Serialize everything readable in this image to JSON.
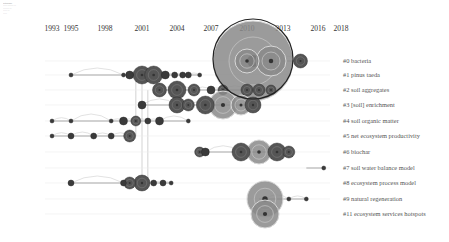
{
  "legend": {
    "lines": [
      "CiteSpace",
      "",
      "",
      "",
      ""
    ]
  },
  "chart_data": {
    "type": "timeline",
    "title": "",
    "xlabel": "",
    "ylabel": "",
    "x_ticks": [
      1993,
      1995,
      1998,
      2001,
      2004,
      2007,
      2010,
      2013,
      2016,
      2018
    ],
    "x_range": [
      1992,
      2018
    ],
    "clusters": [
      {
        "id": 0,
        "label": "#0 bacteria",
        "y": 61,
        "start": 2009,
        "end": 2015,
        "nodes": [
          {
            "year": 2010.5,
            "size": 40
          },
          {
            "year": 2010,
            "size": 12
          },
          {
            "year": 2012,
            "size": 15
          },
          {
            "year": 2014.5,
            "size": 7
          }
        ]
      },
      {
        "id": 1,
        "label": "#1 pinus taeda",
        "y": 75,
        "start": 1995,
        "end": 2018,
        "nodes": [
          {
            "year": 1995,
            "size": 2
          },
          {
            "year": 1999.5,
            "size": 2
          },
          {
            "year": 2000,
            "size": 4
          },
          {
            "year": 2001,
            "size": 9
          },
          {
            "year": 2002,
            "size": 9
          },
          {
            "year": 2003,
            "size": 4
          },
          {
            "year": 2003.8,
            "size": 3
          },
          {
            "year": 2004.5,
            "size": 3
          },
          {
            "year": 2005,
            "size": 3
          },
          {
            "year": 2006,
            "size": 2
          }
        ]
      },
      {
        "id": 2,
        "label": "#2 soil aggregates",
        "y": 90,
        "start": 2002,
        "end": 2018,
        "nodes": [
          {
            "year": 2002.5,
            "size": 7
          },
          {
            "year": 2004,
            "size": 9
          },
          {
            "year": 2005.5,
            "size": 6
          },
          {
            "year": 2007,
            "size": 4
          },
          {
            "year": 2008,
            "size": 5
          },
          {
            "year": 2010,
            "size": 6
          },
          {
            "year": 2011,
            "size": 6
          },
          {
            "year": 2012,
            "size": 5
          }
        ]
      },
      {
        "id": 3,
        "label": "#3 [soil] enrichment",
        "y": 105,
        "start": 2001,
        "end": 2018,
        "nodes": [
          {
            "year": 2001,
            "size": 4
          },
          {
            "year": 2004,
            "size": 8
          },
          {
            "year": 2005,
            "size": 6
          },
          {
            "year": 2006.5,
            "size": 9
          },
          {
            "year": 2008,
            "size": 14
          },
          {
            "year": 2009.5,
            "size": 10
          },
          {
            "year": 2010.5,
            "size": 8
          }
        ]
      },
      {
        "id": 4,
        "label": "#4 soil organic matter",
        "y": 121,
        "start": 1993,
        "end": 2018,
        "nodes": [
          {
            "year": 1993,
            "size": 2
          },
          {
            "year": 1995,
            "size": 2
          },
          {
            "year": 1998.5,
            "size": 2
          },
          {
            "year": 1999.5,
            "size": 4
          },
          {
            "year": 2000.5,
            "size": 5
          },
          {
            "year": 2001.5,
            "size": 3
          },
          {
            "year": 2002.5,
            "size": 4
          },
          {
            "year": 2005,
            "size": 2
          }
        ]
      },
      {
        "id": 5,
        "label": "#5 net ecosystem productivity",
        "y": 136,
        "start": 1993,
        "end": 2018,
        "nodes": [
          {
            "year": 1993,
            "size": 2
          },
          {
            "year": 1995,
            "size": 3
          },
          {
            "year": 1997,
            "size": 3
          },
          {
            "year": 1998.5,
            "size": 3
          },
          {
            "year": 2000,
            "size": 6
          }
        ]
      },
      {
        "id": 6,
        "label": "#6 biochar",
        "y": 152,
        "start": 2006,
        "end": 2018,
        "nodes": [
          {
            "year": 2006,
            "size": 5
          },
          {
            "year": 2006.5,
            "size": 4
          },
          {
            "year": 2009.5,
            "size": 9
          },
          {
            "year": 2011,
            "size": 12
          },
          {
            "year": 2012.5,
            "size": 9
          },
          {
            "year": 2013.5,
            "size": 6
          }
        ]
      },
      {
        "id": 7,
        "label": "#7 soil water balance model",
        "y": 168,
        "start": 2015,
        "end": 2018,
        "nodes": [
          {
            "year": 2016.5,
            "size": 2
          }
        ]
      },
      {
        "id": 8,
        "label": "#8 ecosystem process model",
        "y": 183,
        "start": 1995,
        "end": 2018,
        "nodes": [
          {
            "year": 1995,
            "size": 3
          },
          {
            "year": 1999.5,
            "size": 3
          },
          {
            "year": 2000,
            "size": 6
          },
          {
            "year": 2001,
            "size": 8
          },
          {
            "year": 2002,
            "size": 3
          },
          {
            "year": 2002.8,
            "size": 3
          },
          {
            "year": 2003.5,
            "size": 2
          }
        ]
      },
      {
        "id": 9,
        "label": "#9 natural regeneration",
        "y": 199,
        "start": 2011,
        "end": 2018,
        "nodes": [
          {
            "year": 2011.5,
            "size": 18
          },
          {
            "year": 2013.5,
            "size": 2
          },
          {
            "year": 2015,
            "size": 2
          }
        ]
      },
      {
        "id": 11,
        "label": "#11 ecosystem services hotspots",
        "y": 214,
        "start": 2011,
        "end": 2018,
        "nodes": [
          {
            "year": 2011.5,
            "size": 14
          }
        ]
      }
    ],
    "grid": false,
    "legend_position": "right"
  },
  "colors": {
    "node_fill": "#8a8a8a",
    "node_dark": "#3a3a3a",
    "node_ring": "#d8d8d8",
    "line": "#a8a8a8",
    "link": "#cfcfcf",
    "text": "#444444"
  }
}
